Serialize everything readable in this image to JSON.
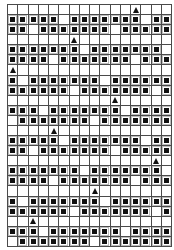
{
  "pattern": {
    "columns": 16,
    "rows_count": 24,
    "legend": {
      "1": "filled-square",
      "0": "empty",
      "T": "triangle"
    },
    "colors": {
      "line": "#4a4a4a",
      "fill": "#111111",
      "background": "#ffffff"
    },
    "rows": [
      "000000000000T000",
      "1111101111111011",
      "1101111111011111",
      "000000T000000000",
      "1111111011111110",
      "1111011111110111",
      "T000000000000000",
      "1011111110111111",
      "1111110111111101",
      "0000000000T00000",
      "1110111111101111",
      "0111111101111111",
      "0000T00000000000",
      "1111101111111011",
      "1101111111011111",
      "00000000000000T0",
      "1111111011111110",
      "1111011111110111",
      "00000000T0000000",
      "1011111110111111",
      "1111110111111101",
      "00T0000000000000",
      "1110111111101111",
      "0111111101111111"
    ]
  }
}
